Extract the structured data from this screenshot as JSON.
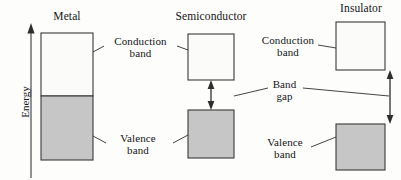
{
  "figure": {
    "kind": "energy-band-diagram",
    "axis": {
      "label": "Energy",
      "direction": "up"
    },
    "colors": {
      "conduction_fill": "#fbfbf9",
      "valence_fill": "#c6c6c6",
      "stroke": "#3a3a3a",
      "text": "#141414",
      "background": "#fdfdfc"
    },
    "materials": [
      {
        "id": "metal",
        "title": "Metal",
        "has_gap": false,
        "bands": [
          "conduction",
          "valence"
        ]
      },
      {
        "id": "semiconductor",
        "title": "Semiconductor",
        "has_gap": true,
        "gap_size": "small",
        "bands": [
          "conduction",
          "valence"
        ]
      },
      {
        "id": "insulator",
        "title": "Insulator",
        "has_gap": true,
        "gap_size": "large",
        "bands": [
          "conduction",
          "valence"
        ]
      }
    ],
    "labels": {
      "conduction_band_left": "Conduction\nband",
      "valence_band_left": "Valence\nband",
      "band_gap": "Band\ngap",
      "conduction_band_right": "Conduction\nband",
      "valence_band_right": "Valence\nband"
    }
  }
}
